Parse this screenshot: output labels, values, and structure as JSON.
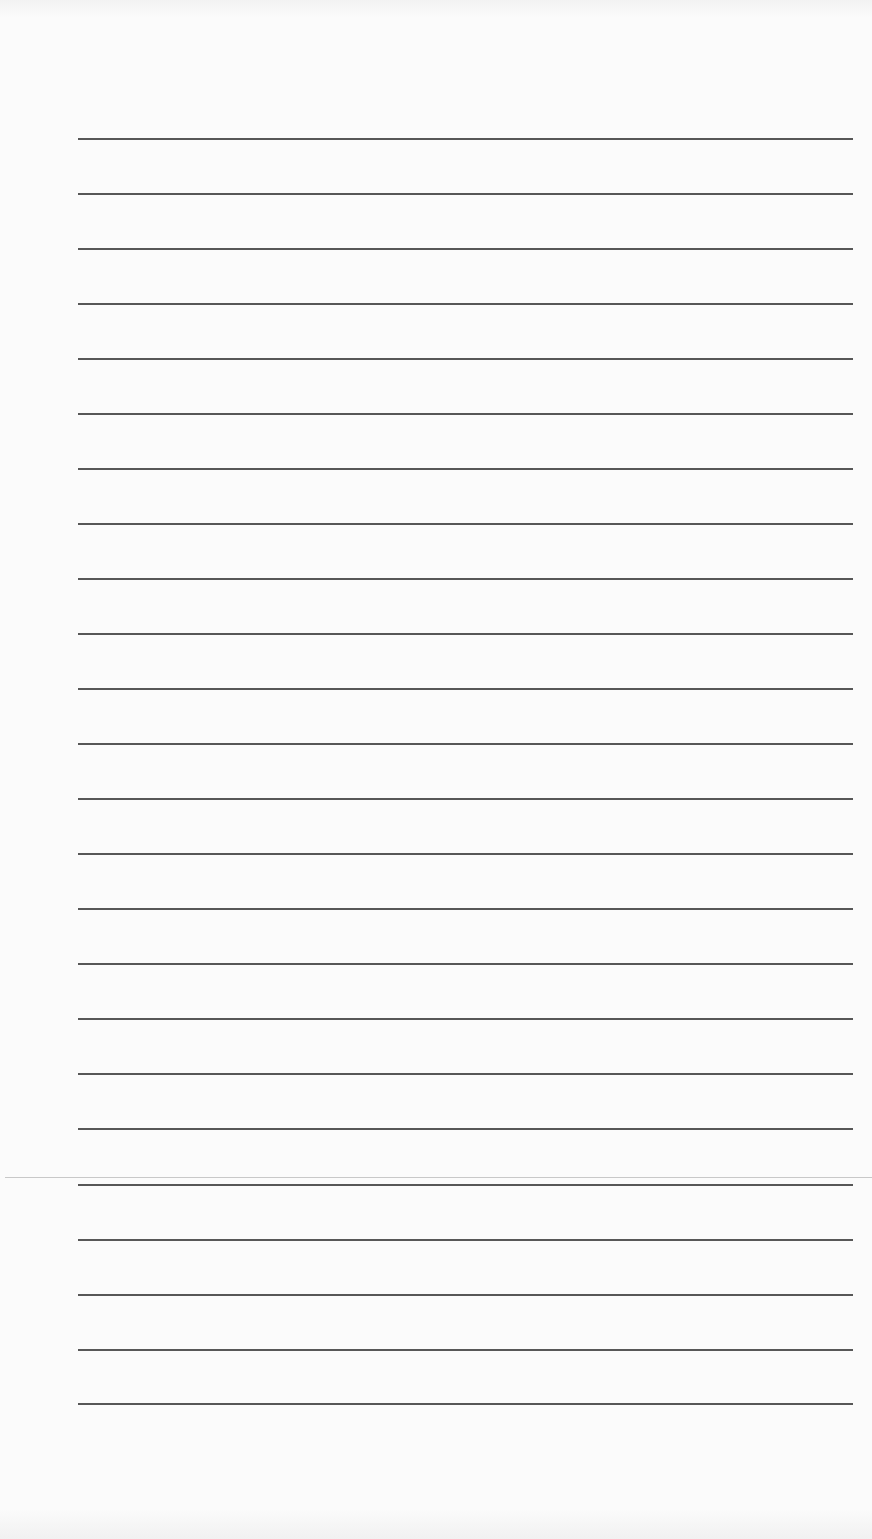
{
  "page": {
    "type": "blank lined paper",
    "background": "#fbfbfb",
    "rule_color": "#3a3a3a",
    "rule_count": 24,
    "rule_left": 78,
    "rule_width": 775,
    "rule_positions": [
      138,
      193,
      248,
      303,
      358,
      413,
      468,
      523,
      578,
      633,
      688,
      743,
      798,
      853,
      908,
      963,
      1018,
      1073,
      1128,
      1184,
      1239,
      1294,
      1349,
      1403
    ],
    "seam_y": 1177,
    "seam_color": "#c8c8c8"
  }
}
